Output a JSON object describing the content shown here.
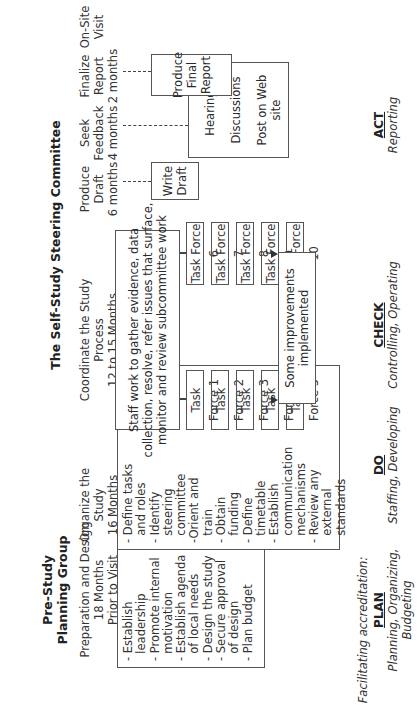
{
  "diagram": {
    "orientation": "rotated-90-ccw",
    "groups": {
      "pre_study": "Pre-Study\nPlanning Group",
      "steering": "The Self-Study Steering Committee"
    },
    "stages": [
      {
        "title": "Preparation and Design\n18 Months\nPrior to Visit"
      },
      {
        "title": "Organize the\nStudy\n16 Months"
      },
      {
        "title": "Coordinate the Study\nProcess\n12 to 15 Months"
      },
      {
        "title": "Produce\nDraft\n6 months"
      },
      {
        "title": "Seek\nFeedback\n4 months"
      },
      {
        "title": "Finalize\nReport\n2 months"
      },
      {
        "title": "On-Site\nVisit"
      }
    ],
    "boxes": {
      "prep": "- Establish\n  leadership\n- Promote internal\n  motivation\n- Establish agenda\n  of local needs\n- Design the study\n- Secure approval\n  of design\n- Plan budget",
      "organize": "- Define tasks\n  and roles\n- Identify\n  steering\n  committee\n-Orient and\n  train\n- Obtain\n  funding\n- Define\n  timetable\n- Establish\n  communication\n  mechanisms\n- Review any\n  external\n  standards",
      "coordinate": "Staff work to gather evidence, data\ncollection, resolve, refer issues that surface,\nmonitor and review subcommittee work",
      "write_draft": "Write\nDraft",
      "feedback": [
        "Hearings",
        "Discussions",
        "Post on Web\nsite"
      ],
      "final_report": "Produce\nFinal\nReport",
      "improvements": "Some improvements implemented"
    },
    "task_forces_left": [
      "Task Force 1",
      "Task Force 2",
      "Task Force 3",
      "Task Force 4",
      "Task Force 5"
    ],
    "task_forces_right": [
      "Task Force 6",
      "Task Force 7",
      "Task Force 8",
      "Task Force 9",
      "Task Force 10"
    ],
    "footer": {
      "intro": "Facilitating accreditation:",
      "phases": [
        {
          "name": "PLAN",
          "desc": "Planning, Organizing,\nBudgeting"
        },
        {
          "name": "DO",
          "desc": "Staffing, Developing"
        },
        {
          "name": "CHECK",
          "desc": "Controlling, Operating"
        },
        {
          "name": "ACT",
          "desc": "Reporting"
        }
      ]
    }
  }
}
